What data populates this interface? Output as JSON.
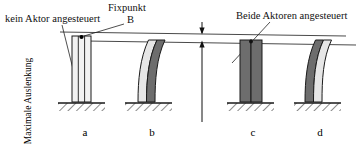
{
  "figure": {
    "type": "technical-diagram",
    "colors": {
      "light_layer": "#e6e6e6",
      "dark_layer": "#6d6d6d",
      "outline": "#1a1a1a",
      "background": "#ffffff",
      "reference_line": "#4a4a4a"
    }
  },
  "labels": {
    "no_actuator": "kein Aktor angesteuert",
    "fixed_point": "Fixpunkt",
    "fixed_point_marker": "B",
    "both_actuators": "Beide Aktoren angesteuert",
    "max_deflection": "Maximale Auslenkung"
  },
  "captions": {
    "a": "a",
    "b": "b",
    "c": "c",
    "d": "d"
  },
  "cases": [
    {
      "id": "a",
      "caption": "a",
      "state": "kein Aktor angesteuert",
      "shape": "straight",
      "left_layer": "light",
      "right_layer": "light",
      "deflection": 0
    },
    {
      "id": "b",
      "caption": "b",
      "state": "ein Aktor angesteuert",
      "shape": "curved-right",
      "left_layer": "light",
      "right_layer": "dark",
      "deflection": 1
    },
    {
      "id": "c",
      "caption": "c",
      "state": "Beide Aktoren angesteuert",
      "shape": "straight",
      "left_layer": "dark",
      "right_layer": "dark",
      "deflection": 0
    },
    {
      "id": "d",
      "caption": "d",
      "state": "ein Aktor angesteuert",
      "shape": "curved-left",
      "left_layer": "dark",
      "right_layer": "light",
      "deflection": 1
    }
  ],
  "reference_lines": {
    "upper_label": "Ebene maximale Auslenkung",
    "lower_label": "Ebene Ruhelage"
  }
}
